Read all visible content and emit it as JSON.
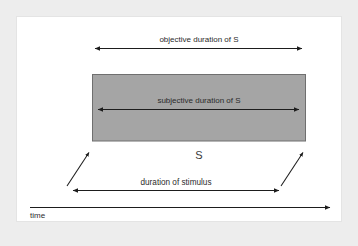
{
  "figure": {
    "type": "timing-diagram",
    "background_color": "#ededed",
    "panel_color": "#ffffff",
    "panel_border_color": "#e4e4e4"
  },
  "stimulus_block": {
    "label": "S",
    "fill_color": "#a5a5a5",
    "border_color": "#6f6f6f"
  },
  "measures": {
    "objective": {
      "label": "objective duration of S",
      "arrow_style": "double-headed"
    },
    "subjective": {
      "label": "subjective duration of S",
      "arrow_style": "double-headed"
    },
    "stimulus": {
      "label": "duration of stimulus",
      "arrow_style": "double-headed"
    }
  },
  "connectors": {
    "left_pointer_name": "stimulus-onset-pointer",
    "right_pointer_name": "stimulus-offset-pointer",
    "arrow_style": "single-headed"
  },
  "axis": {
    "label": "time",
    "arrow_style": "single-headed-right"
  }
}
